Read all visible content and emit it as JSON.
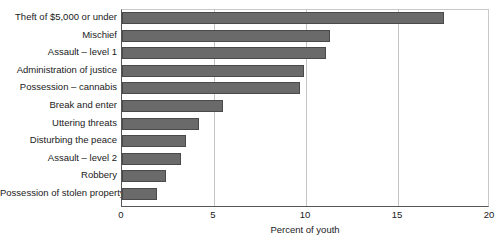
{
  "chart_data": {
    "type": "bar",
    "orientation": "horizontal",
    "title": "",
    "subtitle": "",
    "xlabel": "Percent of youth",
    "ylabel": "",
    "xlim": [
      0,
      20
    ],
    "ylim": null,
    "xticks": [
      "0",
      "5",
      "10",
      "15",
      "20"
    ],
    "xtick_values": [
      0,
      5,
      10,
      15,
      20
    ],
    "grid": "vertical",
    "legend": null,
    "legend_position": "none",
    "bar_color": "#6a6a6a",
    "bar_edge_color": "#4a4a4a",
    "axis_color": "#555555",
    "gridline_color": "#c4c4c4",
    "categories": [
      "Theft of $5,000 or under",
      "Mischief",
      "Assault – level 1",
      "Administration of justice",
      "Possession – cannabis",
      "Break and enter",
      "Uttering threats",
      "Disturbing the peace",
      "Assault – level 2",
      "Robbery",
      "Possession of stolen property"
    ],
    "values": [
      17.5,
      11.3,
      11.1,
      9.9,
      9.7,
      5.5,
      4.2,
      3.5,
      3.2,
      2.4,
      1.9
    ]
  }
}
